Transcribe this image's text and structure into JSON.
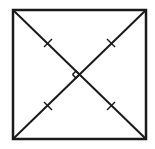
{
  "diagram": {
    "square": {
      "x1": 13,
      "y1": 10,
      "x2": 146,
      "y2": 139
    },
    "diagonals": [
      {
        "name": "diagonal-tl-br",
        "from": "top-left",
        "to": "bottom-right"
      },
      {
        "name": "diagonal-bl-tr",
        "from": "bottom-left",
        "to": "top-right"
      }
    ],
    "intersection": {
      "x": 79.5,
      "y": 74.5
    },
    "marks": {
      "right_angle": "left",
      "tick_marks_per_half_diagonal": 1,
      "tick_count": 4
    },
    "colors": {
      "stroke": "#1a1a1a",
      "background": "#ffffff"
    }
  }
}
